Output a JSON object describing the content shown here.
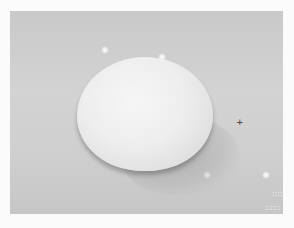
{
  "image": {
    "subject": "egg",
    "description": "A single white egg resting on a light gray surface with a soft shadow",
    "colors": {
      "background": "#cfcfcf",
      "egg": "#eeeeee",
      "shadow": "#8c8c8c",
      "border": "#fbfbfb"
    }
  }
}
